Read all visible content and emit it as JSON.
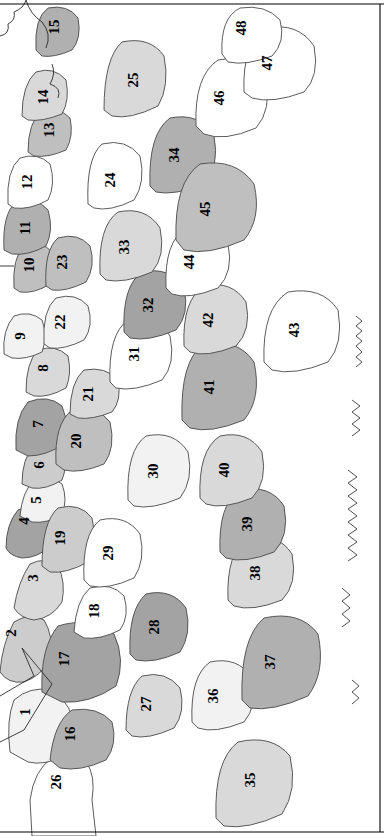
{
  "figure": {
    "kind": "choropleth-map",
    "orientation": "rotated-90-ccw",
    "border_color": "#000000",
    "outline_color": "#3a3a3a",
    "region_count": 48
  },
  "palette": {
    "white": "#ffffff",
    "lightest": "#f2f2f2",
    "lighter": "#e6e6e6",
    "light": "#d9d9d9",
    "mid_light": "#cccccc",
    "mid": "#bfbfbf",
    "mid_dark": "#b0b0b0",
    "dark": "#a3a3a3",
    "darkest": "#949494"
  },
  "regions": [
    {
      "id": 1,
      "label": "1",
      "shade": "lightest",
      "x": 27,
      "y": 712
    },
    {
      "id": 2,
      "label": "2",
      "shade": "mid_light",
      "x": 13,
      "y": 633
    },
    {
      "id": 3,
      "label": "3",
      "shade": "light",
      "x": 35,
      "y": 578
    },
    {
      "id": 4,
      "label": "4",
      "shade": "dark",
      "x": 26,
      "y": 521
    },
    {
      "id": 5,
      "label": "5",
      "shade": "lightest",
      "x": 38,
      "y": 500
    },
    {
      "id": 6,
      "label": "6",
      "shade": "mid_light",
      "x": 41,
      "y": 465
    },
    {
      "id": 7,
      "label": "7",
      "shade": "dark",
      "x": 40,
      "y": 424
    },
    {
      "id": 8,
      "label": "8",
      "shade": "light",
      "x": 45,
      "y": 368
    },
    {
      "id": 9,
      "label": "9",
      "shade": "lightest",
      "x": 22,
      "y": 336
    },
    {
      "id": 10,
      "label": "10",
      "shade": "mid",
      "x": 31,
      "y": 265
    },
    {
      "id": 11,
      "label": "11",
      "shade": "mid_dark",
      "x": 27,
      "y": 228
    },
    {
      "id": 12,
      "label": "12",
      "shade": "white",
      "x": 29,
      "y": 182
    },
    {
      "id": 13,
      "label": "13",
      "shade": "mid",
      "x": 51,
      "y": 130
    },
    {
      "id": 14,
      "label": "14",
      "shade": "light",
      "x": 45,
      "y": 97
    },
    {
      "id": 15,
      "label": "15",
      "shade": "mid_dark",
      "x": 56,
      "y": 27
    },
    {
      "id": 16,
      "label": "16",
      "shade": "mid_dark",
      "x": 72,
      "y": 734
    },
    {
      "id": 17,
      "label": "17",
      "shade": "dark",
      "x": 66,
      "y": 659
    },
    {
      "id": 18,
      "label": "18",
      "shade": "white",
      "x": 96,
      "y": 611
    },
    {
      "id": 19,
      "label": "19",
      "shade": "mid_light",
      "x": 62,
      "y": 538
    },
    {
      "id": 20,
      "label": "20",
      "shade": "mid",
      "x": 78,
      "y": 441
    },
    {
      "id": 21,
      "label": "21",
      "shade": "light",
      "x": 90,
      "y": 394
    },
    {
      "id": 22,
      "label": "22",
      "shade": "lightest",
      "x": 62,
      "y": 322
    },
    {
      "id": 23,
      "label": "23",
      "shade": "mid",
      "x": 64,
      "y": 262
    },
    {
      "id": 24,
      "label": "24",
      "shade": "white",
      "x": 112,
      "y": 180
    },
    {
      "id": 25,
      "label": "25",
      "shade": "light",
      "x": 135,
      "y": 80
    },
    {
      "id": 26,
      "label": "26",
      "shade": "white",
      "x": 58,
      "y": 782
    },
    {
      "id": 27,
      "label": "27",
      "shade": "light",
      "x": 148,
      "y": 704
    },
    {
      "id": 28,
      "label": "28",
      "shade": "dark",
      "x": 156,
      "y": 627
    },
    {
      "id": 29,
      "label": "29",
      "shade": "white",
      "x": 110,
      "y": 553
    },
    {
      "id": 30,
      "label": "30",
      "shade": "lightest",
      "x": 155,
      "y": 471
    },
    {
      "id": 31,
      "label": "31",
      "shade": "white",
      "x": 136,
      "y": 354
    },
    {
      "id": 32,
      "label": "32",
      "shade": "dark",
      "x": 150,
      "y": 305
    },
    {
      "id": 33,
      "label": "33",
      "shade": "light",
      "x": 126,
      "y": 247
    },
    {
      "id": 34,
      "label": "34",
      "shade": "mid_dark",
      "x": 176,
      "y": 155
    },
    {
      "id": 35,
      "label": "35",
      "shade": "light",
      "x": 252,
      "y": 780
    },
    {
      "id": 36,
      "label": "36",
      "shade": "lightest",
      "x": 215,
      "y": 696
    },
    {
      "id": 37,
      "label": "37",
      "shade": "mid_dark",
      "x": 272,
      "y": 662
    },
    {
      "id": 38,
      "label": "38",
      "shade": "light",
      "x": 257,
      "y": 573
    },
    {
      "id": 39,
      "label": "39",
      "shade": "mid_dark",
      "x": 249,
      "y": 524
    },
    {
      "id": 40,
      "label": "40",
      "shade": "light",
      "x": 226,
      "y": 470
    },
    {
      "id": 41,
      "label": "41",
      "shade": "mid_dark",
      "x": 211,
      "y": 387
    },
    {
      "id": 42,
      "label": "42",
      "shade": "light",
      "x": 210,
      "y": 320
    },
    {
      "id": 43,
      "label": "43",
      "shade": "white",
      "x": 296,
      "y": 330
    },
    {
      "id": 44,
      "label": "44",
      "shade": "white",
      "x": 191,
      "y": 262
    },
    {
      "id": 45,
      "label": "45",
      "shade": "mid",
      "x": 207,
      "y": 209
    },
    {
      "id": 46,
      "label": "46",
      "shade": "white",
      "x": 221,
      "y": 98
    },
    {
      "id": 47,
      "label": "47",
      "shade": "white",
      "x": 269,
      "y": 63
    },
    {
      "id": 48,
      "label": "48",
      "shade": "white",
      "x": 243,
      "y": 28
    }
  ]
}
